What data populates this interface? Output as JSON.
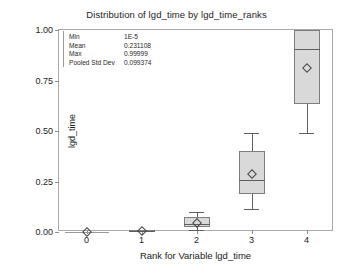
{
  "chart_data": {
    "type": "box",
    "title": "Distribution of lgd_time by lgd_time_ranks",
    "xlabel": "Rank for Variable lgd_time",
    "ylabel": "lgd_time",
    "categories": [
      "0",
      "1",
      "2",
      "3",
      "4"
    ],
    "ylim": [
      0.0,
      1.0
    ],
    "yticks": [
      "0.00",
      "0.25",
      "0.50",
      "0.75",
      "1.00"
    ],
    "ytick_values": [
      0.0,
      0.25,
      0.5,
      0.75,
      1.0
    ],
    "grid": false,
    "legend": "none",
    "boxes": [
      {
        "category": "0",
        "whisker_low": 0.0,
        "q1": 0.0,
        "median": 0.0,
        "q3": 0.0,
        "whisker_high": 0.0,
        "mean": 0.0
      },
      {
        "category": "1",
        "whisker_low": 0.001,
        "q1": 0.003,
        "median": 0.005,
        "q3": 0.008,
        "whisker_high": 0.011,
        "mean": 0.005
      },
      {
        "category": "2",
        "whisker_low": 0.012,
        "q1": 0.024,
        "median": 0.042,
        "q3": 0.072,
        "whisker_high": 0.1,
        "mean": 0.046
      },
      {
        "category": "3",
        "whisker_low": 0.115,
        "q1": 0.19,
        "median": 0.258,
        "q3": 0.4,
        "whisker_high": 0.488,
        "mean": 0.285
      },
      {
        "category": "4",
        "whisker_low": 0.488,
        "q1": 0.632,
        "median": 0.905,
        "q3": 1.0,
        "whisker_high": 1.0,
        "mean": 0.812
      }
    ],
    "stats": [
      {
        "name": "Min",
        "value": "1E-5"
      },
      {
        "name": "Mean",
        "value": "0.231108"
      },
      {
        "name": "Max",
        "value": "0.99999"
      },
      {
        "name": "Pooled Std Dev",
        "value": "0.099374"
      }
    ],
    "colors": {
      "box_fill": "#d9d9d9",
      "box_border": "#7d7d7d",
      "whisker": "#5f5f5f",
      "frame": "#a9a9a9",
      "text": "#222222"
    }
  }
}
